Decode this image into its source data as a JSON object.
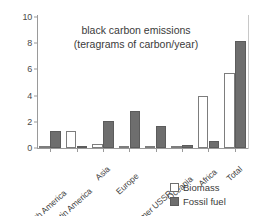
{
  "chart_data": {
    "type": "bar",
    "title": "black carbon emissions (teragrams of carbon/year)",
    "title_lines": [
      "black carbon emissions",
      "(teragrams of carbon/year)"
    ],
    "xlabel": "",
    "ylabel": "",
    "ylim": [
      0,
      10
    ],
    "yticks": [
      0,
      2,
      4,
      6,
      8,
      10
    ],
    "ytick_labels": [
      "0",
      "2",
      "4",
      "6",
      "8",
      "10"
    ],
    "grid": false,
    "legend_position": "bottom-right",
    "categories": [
      "North America",
      "Latin America",
      "Asia",
      "Europe",
      "Former USSR",
      "Oceania",
      "Africa",
      "Total"
    ],
    "series": [
      {
        "name": "Biomass",
        "color": "#ffffff",
        "values": [
          0.05,
          1.3,
          0.3,
          0.03,
          0.15,
          0.05,
          4.0,
          5.7
        ]
      },
      {
        "name": "Fossil fuel",
        "color": "#6e6e6e",
        "values": [
          1.3,
          0.15,
          2.05,
          2.8,
          1.7,
          0.2,
          0.5,
          8.2
        ]
      }
    ]
  },
  "legend": {
    "items": [
      {
        "label": "Biomass",
        "swatch": "biomass"
      },
      {
        "label": "Fossil fuel",
        "swatch": "fossil"
      }
    ]
  }
}
